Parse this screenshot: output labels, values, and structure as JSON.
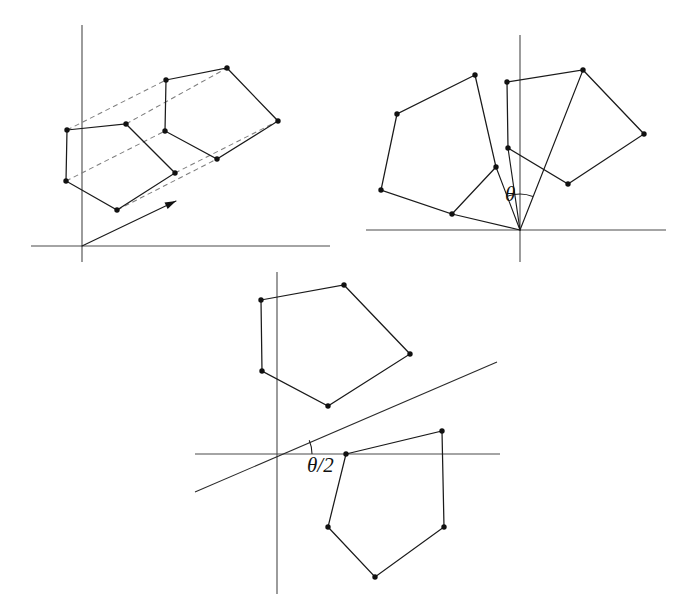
{
  "figure": {
    "width": 689,
    "height": 608,
    "background_color": "#ffffff",
    "ink_color": "#111111",
    "axis_color": "#4a4a4a",
    "dash_color": "#7d7d7d"
  },
  "labels": {
    "theta": "θ",
    "theta_half": "θ/2"
  },
  "panels": [
    {
      "id": "panel-translation",
      "name": "translation-panel",
      "caption": "",
      "origin": [
        82,
        246
      ],
      "axes": {
        "x_axis": [
          31,
          246,
          330,
          246
        ],
        "y_axis": [
          82,
          25,
          82,
          262
        ]
      },
      "shapes": [
        {
          "name": "source-pentagon",
          "style": "solid",
          "points": [
            [
              67,
              130
            ],
            [
              126,
              124
            ],
            [
              175,
              173
            ],
            [
              117,
              210
            ],
            [
              66,
              181
            ]
          ]
        },
        {
          "name": "translated-pentagon",
          "style": "solid",
          "points": [
            [
              166,
              80
            ],
            [
              227,
              68
            ],
            [
              278,
              121
            ],
            [
              217,
              159
            ],
            [
              165,
              131
            ]
          ]
        }
      ],
      "connectors": [
        {
          "name": "translation-dash-1",
          "from": [
            67,
            130
          ],
          "to": [
            166,
            80
          ]
        },
        {
          "name": "translation-dash-2",
          "from": [
            126,
            124
          ],
          "to": [
            227,
            68
          ]
        },
        {
          "name": "translation-dash-3",
          "from": [
            175,
            173
          ],
          "to": [
            278,
            121
          ]
        },
        {
          "name": "translation-dash-4",
          "from": [
            117,
            210
          ],
          "to": [
            217,
            159
          ]
        },
        {
          "name": "translation-dash-5",
          "from": [
            66,
            181
          ],
          "to": [
            165,
            131
          ]
        }
      ],
      "arrow": {
        "name": "translation-vector-arrow",
        "from": [
          82,
          246
        ],
        "to": [
          176,
          201
        ]
      }
    },
    {
      "id": "panel-rotation",
      "name": "rotation-angle-panel",
      "caption": "",
      "origin": [
        520,
        230
      ],
      "axes": {
        "x_axis": [
          366,
          230,
          666,
          230
        ],
        "y_axis": [
          520,
          35,
          520,
          262
        ]
      },
      "shapes": [
        {
          "name": "rotated-pentagon-left",
          "style": "solid",
          "points": [
            [
              475,
              75
            ],
            [
              397,
              114
            ],
            [
              381,
              190
            ],
            [
              452,
              214
            ],
            [
              496,
              167
            ]
          ]
        },
        {
          "name": "rotated-pentagon-right",
          "style": "solid",
          "points": [
            [
              507,
              82
            ],
            [
              583,
              70
            ],
            [
              644,
              134
            ],
            [
              568,
              184
            ],
            [
              508,
              148
            ]
          ]
        }
      ],
      "rays": [
        {
          "name": "ray-to-left-pentagon",
          "from": [
            520,
            230
          ],
          "to": [
            496,
            167
          ]
        },
        {
          "name": "ray-to-left-pentagon-far",
          "from": [
            520,
            230
          ],
          "to": [
            452,
            214
          ]
        },
        {
          "name": "ray-to-right-pentagon",
          "from": [
            520,
            230
          ],
          "to": [
            583,
            70
          ]
        },
        {
          "name": "ray-to-right-pentagon-near",
          "from": [
            520,
            230
          ],
          "to": [
            508,
            148
          ]
        }
      ],
      "angle_arc": {
        "name": "theta-arc",
        "center": [
          520,
          230
        ],
        "radius": 36,
        "start_deg": 110,
        "end_deg": 69
      },
      "angle_label": {
        "name": "theta-label",
        "text_key": "theta",
        "position": [
          505,
          196
        ]
      }
    },
    {
      "id": "panel-reflection",
      "name": "reflection-axis-panel",
      "caption": "",
      "origin": [
        277,
        454
      ],
      "axes": {
        "x_axis": [
          195,
          454,
          500,
          454
        ],
        "y_axis": [
          277,
          272,
          277,
          594
        ]
      },
      "shapes": [
        {
          "name": "reflected-pentagon-upper",
          "style": "solid",
          "points": [
            [
              261,
              300
            ],
            [
              344,
              285
            ],
            [
              410,
              354
            ],
            [
              328,
              406
            ],
            [
              262,
              371
            ]
          ]
        },
        {
          "name": "reflected-pentagon-lower",
          "style": "solid",
          "points": [
            [
              346,
              454
            ],
            [
              442,
              431
            ],
            [
              444,
              527
            ],
            [
              375,
              577
            ],
            [
              328,
              527
            ]
          ]
        }
      ],
      "mirror": {
        "name": "half-angle-mirror-line",
        "from": [
          195,
          492
        ],
        "to": [
          497,
          362
        ]
      },
      "angle_arc": {
        "name": "theta-half-arc",
        "center": [
          277,
          454
        ],
        "radius": 35,
        "start_deg": 0,
        "end_deg": 23
      },
      "angle_label": {
        "name": "theta-half-label",
        "text_key": "theta_half",
        "position": [
          307,
          467
        ]
      }
    }
  ]
}
